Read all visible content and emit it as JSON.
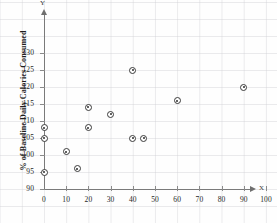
{
  "chart_data": {
    "type": "scatter",
    "title": "",
    "xlabel": "X",
    "ylabel": "% of Baseline Daily Calories Consumed",
    "axis_letters": {
      "x": "X",
      "y": "Y"
    },
    "xlim": [
      0,
      105
    ],
    "ylim": [
      90,
      133
    ],
    "xticks": [
      0,
      10,
      20,
      30,
      40,
      50,
      60,
      70,
      80,
      90,
      100
    ],
    "xtick_labels": [
      "0",
      "10",
      "20",
      "30",
      "40",
      "50",
      "60",
      "70",
      "80",
      "90",
      "100"
    ],
    "yticks": [
      90,
      95,
      100,
      105,
      110,
      115,
      120,
      125,
      130
    ],
    "ytick_labels": [
      "90",
      "95",
      "100",
      "105",
      "110",
      "115",
      "120",
      "125",
      "130"
    ],
    "grid": true,
    "legend": null,
    "points": [
      {
        "x": 0,
        "y": 108
      },
      {
        "x": 0,
        "y": 105
      },
      {
        "x": 0,
        "y": 95
      },
      {
        "x": 10,
        "y": 101
      },
      {
        "x": 15,
        "y": 96
      },
      {
        "x": 20,
        "y": 114
      },
      {
        "x": 20,
        "y": 108
      },
      {
        "x": 30,
        "y": 112
      },
      {
        "x": 40,
        "y": 125
      },
      {
        "x": 40,
        "y": 105
      },
      {
        "x": 45,
        "y": 105
      },
      {
        "x": 60,
        "y": 116
      },
      {
        "x": 90,
        "y": 120
      }
    ],
    "colors": {
      "marker_edge": "#3a3a3a",
      "marker_fill": "#ffffff",
      "axis": "#7a7a7a",
      "grid": "#cdcdd2",
      "text": "#262626",
      "background": "#fefefe"
    }
  }
}
